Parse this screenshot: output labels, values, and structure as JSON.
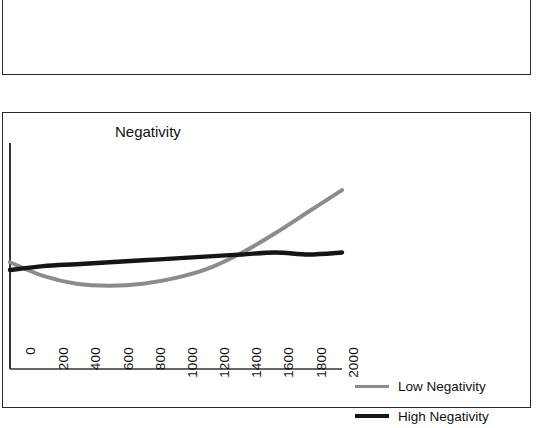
{
  "figure": {
    "panels": [
      {
        "name": "upper-panel",
        "clipped": true,
        "axis_tick_labels": [
          "0",
          "200",
          "400",
          "600",
          "800",
          "1000",
          "1200",
          "1400",
          "1600",
          "1800",
          "2000"
        ]
      },
      {
        "name": "lower-panel",
        "title": "Negativity",
        "axis_tick_labels": [
          "0",
          "200",
          "400",
          "600",
          "800",
          "1000",
          "1200",
          "1400",
          "1600",
          "1800",
          "2000"
        ]
      }
    ]
  },
  "legend": {
    "items": [
      {
        "label": "Low Negativity",
        "color": "#8c8c8c",
        "style": "low"
      },
      {
        "label": "High Negativity",
        "color": "#151515",
        "style": "high"
      }
    ]
  },
  "colors": {
    "low_negativity": "#8c8c8c",
    "high_negativity": "#151515",
    "frame": "#2b2b2b",
    "axis": "#333333",
    "background": "#ffffff"
  },
  "chart_data": {
    "type": "line",
    "title": "Negativity",
    "xlabel": "",
    "ylabel": "",
    "xlim": [
      0,
      2000
    ],
    "ylim": [
      0,
      1
    ],
    "grid": false,
    "legend_position": "right",
    "x": [
      0,
      200,
      400,
      600,
      800,
      1000,
      1200,
      1400,
      1600,
      1800,
      2000
    ],
    "series": [
      {
        "name": "Low Negativity",
        "color": "#8c8c8c",
        "values": [
          0.45,
          0.38,
          0.34,
          0.33,
          0.34,
          0.37,
          0.42,
          0.5,
          0.6,
          0.71,
          0.82
        ]
      },
      {
        "name": "High Negativity",
        "color": "#151515",
        "values": [
          0.41,
          0.43,
          0.44,
          0.45,
          0.46,
          0.47,
          0.48,
          0.49,
          0.5,
          0.49,
          0.5
        ]
      }
    ],
    "annotations": [
      "Low Negativity dips to a minimum near x=600 then rises steeply",
      "High Negativity is nearly flat across the full range",
      "Curves cross near x=150 and again near x=1350"
    ]
  }
}
